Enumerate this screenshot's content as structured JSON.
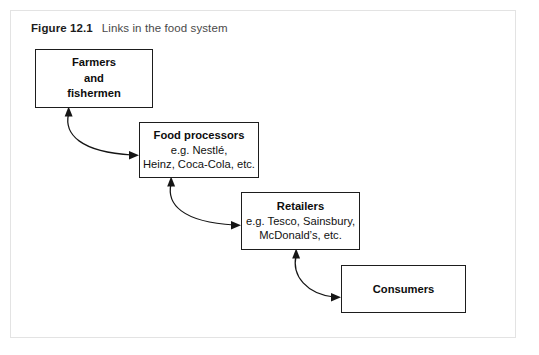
{
  "figure": {
    "label": "Figure 12.1",
    "caption": "Links in the food system"
  },
  "diagram": {
    "type": "flow-chain",
    "orientation": "diagonal-cascade",
    "connector_style": "curved double-headed arrow",
    "nodes": [
      {
        "id": "farmers",
        "title": "Farmers",
        "line2": "and",
        "line3": "fishermen"
      },
      {
        "id": "processors",
        "title": "Food processors",
        "line2": "e.g. Nestlé,",
        "line3": "Heinz, Coca-Cola, etc."
      },
      {
        "id": "retailers",
        "title": "Retailers",
        "line2": "e.g. Tesco, Sainsbury,",
        "line3": "McDonald’s, etc."
      },
      {
        "id": "consumers",
        "title": "Consumers"
      }
    ],
    "links": [
      {
        "from": "farmers",
        "to": "processors",
        "bidirectional": true
      },
      {
        "from": "processors",
        "to": "retailers",
        "bidirectional": true
      },
      {
        "from": "retailers",
        "to": "consumers",
        "bidirectional": true
      }
    ]
  },
  "colors": {
    "page_background": "#ffffff",
    "frame_border": "#e3e3e3",
    "box_border": "#1d1d1d",
    "text": "#111111",
    "caption_label": "#1c1c1c",
    "caption_text": "#4a4a4a",
    "arrow": "#151515"
  }
}
